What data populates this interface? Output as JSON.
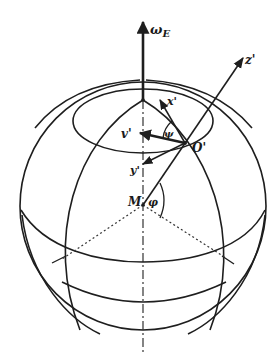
{
  "diagram": {
    "type": "earth-rotating-frame-geometry",
    "labels": {
      "omega": "ω",
      "omega_sub": "E",
      "z_axis": "z'",
      "x_axis": "x'",
      "y_axis": "y'",
      "velocity": "v'",
      "origin": "O'",
      "center": "M",
      "latitude_angle": "φ",
      "azimuth_angle": "ψ"
    },
    "colors": {
      "ink": "#1e1e1e",
      "background": "#ffffff"
    }
  }
}
